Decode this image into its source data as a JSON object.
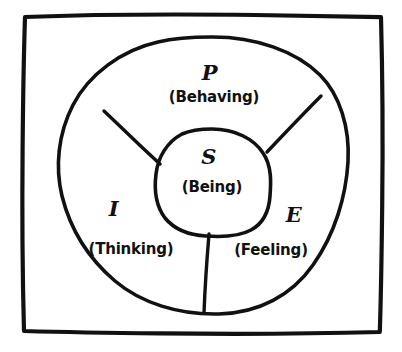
{
  "diagram": {
    "style": "hand-drawn sketch",
    "stroke_color": "#111111",
    "background_color": "#ffffff",
    "frame": {
      "name": "outer-rectangle"
    },
    "outer_shape": {
      "name": "outer-oval"
    },
    "inner_shape": {
      "name": "inner-blob"
    },
    "sectors": [
      {
        "id": "p",
        "position": "top",
        "letter": "P",
        "word": "(Behaving)",
        "letter_x": 210,
        "letter_y": 72,
        "word_x": 214,
        "word_y": 97
      },
      {
        "id": "i",
        "position": "lower-left",
        "letter": "I",
        "word": "(Thinking)",
        "letter_x": 114,
        "letter_y": 208,
        "word_x": 131,
        "word_y": 249
      },
      {
        "id": "e",
        "position": "lower-right",
        "letter": "E",
        "word": "(Feeling)",
        "letter_x": 294,
        "letter_y": 214,
        "word_x": 271,
        "word_y": 250
      }
    ],
    "center": {
      "id": "s",
      "position": "center",
      "letter": "S",
      "word": "(Being)",
      "letter_x": 209,
      "letter_y": 156,
      "word_x": 212,
      "word_y": 187
    }
  }
}
